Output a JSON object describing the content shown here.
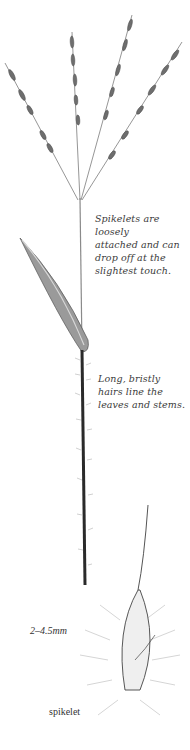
{
  "illustration": {
    "subject": "grass plant with bristly hairs",
    "annotations": {
      "spikelets_note": "Spikelets are loosely\nattached and can\ndrop off at the\nslightest touch.",
      "hairs_note": "Long, bristly\nhairs line the\nleaves and stems."
    },
    "spikelet_detail": {
      "size_label": "2–4.5mm",
      "caption": "spikelet"
    },
    "colors": {
      "ink": "#3a3a3a",
      "stem_dark": "#2a2a2a",
      "leaf_fill": "#9a9a9a",
      "background": "#ffffff"
    }
  }
}
